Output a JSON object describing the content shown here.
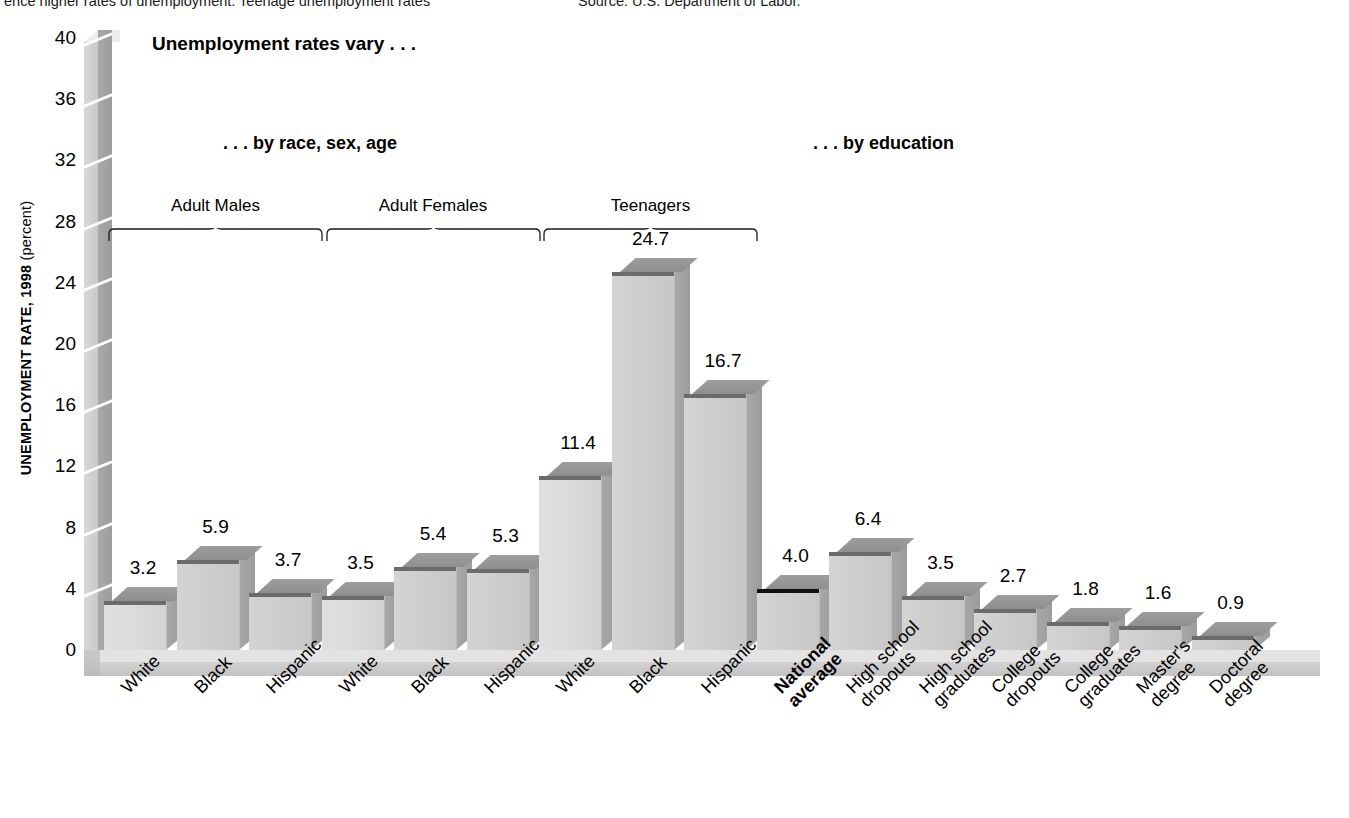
{
  "topnote": {
    "left": "ence higher rates of unemployment. Teenage unemployment rates",
    "right": "Source: U.S. Department of Labor."
  },
  "headline": "Unemployment rates vary . . .",
  "subheads": {
    "left": ". . . by race, sex, age",
    "right": ". . . by education"
  },
  "axis": {
    "ytitle_bold": "UNEMPLOYMENT RATE, 1998",
    "ytitle_plain": " (percent)",
    "yticks": [
      "0",
      "4",
      "8",
      "12",
      "16",
      "20",
      "24",
      "28",
      "32",
      "36",
      "40"
    ]
  },
  "groups": [
    {
      "label": "Adult Males",
      "from": 0,
      "to": 2
    },
    {
      "label": "Adult Females",
      "from": 3,
      "to": 5
    },
    {
      "label": "Teenagers",
      "from": 6,
      "to": 8
    }
  ],
  "chart_data": {
    "type": "bar",
    "title": "Unemployment rates vary . . .",
    "xlabel": "",
    "ylabel": "UNEMPLOYMENT RATE, 1998 (percent)",
    "ylim": [
      0,
      40
    ],
    "yticks": [
      0,
      4,
      8,
      12,
      16,
      20,
      24,
      28,
      32,
      36,
      40
    ],
    "grid": false,
    "legend": "none",
    "categories": [
      "White",
      "Black",
      "Hispanic",
      "White",
      "Black",
      "Hispanic",
      "White",
      "Black",
      "Hispanic",
      "National average",
      "High school dropouts",
      "High school graduates",
      "College dropouts",
      "College graduates",
      "Master's degree",
      "Doctoral degree"
    ],
    "values": [
      3.2,
      5.9,
      3.7,
      3.5,
      5.4,
      5.3,
      11.4,
      24.7,
      16.7,
      4.0,
      6.4,
      3.5,
      2.7,
      1.8,
      1.6,
      0.9
    ],
    "value_labels": [
      "3.2",
      "5.9",
      "3.7",
      "3.5",
      "5.4",
      "5.3",
      "11.4",
      "24.7",
      "16.7",
      "4.0",
      "6.4",
      "3.5",
      "2.7",
      "1.8",
      "1.6",
      "0.9"
    ],
    "highlighted": [
      "National average"
    ],
    "annotations": [
      ". . . by race, sex, age",
      ". . . by education"
    ]
  },
  "categories_display": [
    {
      "l1": "White",
      "l2": "",
      "bold": false
    },
    {
      "l1": "Black",
      "l2": "",
      "bold": false
    },
    {
      "l1": "Hispanic",
      "l2": "",
      "bold": false
    },
    {
      "l1": "White",
      "l2": "",
      "bold": false
    },
    {
      "l1": "Black",
      "l2": "",
      "bold": false
    },
    {
      "l1": "Hispanic",
      "l2": "",
      "bold": false
    },
    {
      "l1": "White",
      "l2": "",
      "bold": false
    },
    {
      "l1": "Black",
      "l2": "",
      "bold": false
    },
    {
      "l1": "Hispanic",
      "l2": "",
      "bold": false
    },
    {
      "l1": "National",
      "l2": "average",
      "bold": true
    },
    {
      "l1": "High school",
      "l2": "dropouts",
      "bold": false
    },
    {
      "l1": "High school",
      "l2": "graduates",
      "bold": false
    },
    {
      "l1": "College",
      "l2": "dropouts",
      "bold": false
    },
    {
      "l1": "College",
      "l2": "graduates",
      "bold": false
    },
    {
      "l1": "Master's",
      "l2": "degree",
      "bold": false
    },
    {
      "l1": "Doctoral",
      "l2": "degree",
      "bold": false
    }
  ],
  "colors": {
    "bar_front": "#cfcfcf",
    "bar_top": "#949494",
    "bar_cap": "#6b6b6b",
    "highlight_cap": "#111111",
    "wall": "#cfcfcf",
    "floor": "#d2d2d2",
    "text": "#000000"
  }
}
